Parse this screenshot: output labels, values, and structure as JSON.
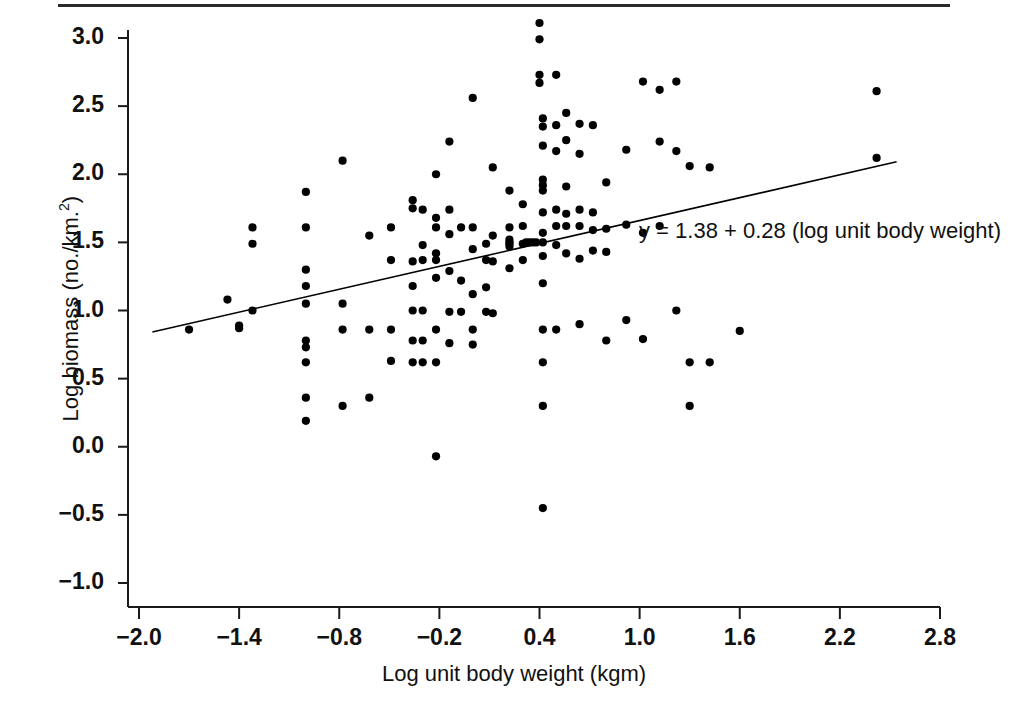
{
  "figure": {
    "background_color": "#ffffff",
    "ink_color": "#000000",
    "rule_color": "#2b2b2b"
  },
  "axes": {
    "x_title": "Log unit body weight (kgm)",
    "y_title_main": "Log biomass (no./km.",
    "y_title_sup": "2",
    "y_title_tail": ")"
  },
  "annotation": {
    "equation": "y = 1.38 + 0.28 (log unit body weight)"
  },
  "chart_data": {
    "type": "scatter",
    "title": "",
    "xlabel": "Log unit body weight (kgm)",
    "ylabel": "Log biomass (no./km.2)",
    "xlim": [
      -2.0,
      2.8
    ],
    "ylim": [
      -1.0,
      3.0
    ],
    "xticks": [
      -2.0,
      -1.4,
      -0.8,
      -0.2,
      0.4,
      1.0,
      1.6,
      2.2,
      2.8
    ],
    "xtick_labels": [
      "−2.0",
      "−1.4",
      "−0.8",
      "−0.2",
      "0.4",
      "1.0",
      "1.6",
      "2.2",
      "2.8"
    ],
    "yticks": [
      -1.0,
      -0.5,
      0.0,
      0.5,
      1.0,
      1.5,
      2.0,
      2.5,
      3.0
    ],
    "ytick_labels": [
      "−1.0",
      "−0.5",
      "0.0",
      "0.5",
      "1.0",
      "1.5",
      "2.0",
      "2.5",
      "3.0"
    ],
    "grid": false,
    "legend": null,
    "marker": {
      "shape": "circle",
      "color": "#000000",
      "size_px": 5
    },
    "fit_line": {
      "label": "y = 1.38 + 0.28 (log unit body weight)",
      "intercept": 1.38,
      "slope": 0.28,
      "x_start": -1.92,
      "x_end": 2.54,
      "color": "#000000",
      "width_px": 1.6
    },
    "points": [
      [
        -1.7,
        0.86
      ],
      [
        -1.47,
        1.08
      ],
      [
        -1.4,
        0.87
      ],
      [
        -1.4,
        0.89
      ],
      [
        -1.32,
        1.61
      ],
      [
        -1.32,
        1.49
      ],
      [
        -1.32,
        1.0
      ],
      [
        -1.0,
        1.87
      ],
      [
        -1.0,
        1.61
      ],
      [
        -1.0,
        1.3
      ],
      [
        -1.0,
        1.18
      ],
      [
        -1.0,
        1.05
      ],
      [
        -1.0,
        0.78
      ],
      [
        -1.0,
        0.73
      ],
      [
        -1.0,
        0.62
      ],
      [
        -1.0,
        0.36
      ],
      [
        -1.0,
        0.19
      ],
      [
        -0.78,
        2.1
      ],
      [
        -0.78,
        1.05
      ],
      [
        -0.78,
        0.86
      ],
      [
        -0.78,
        0.3
      ],
      [
        -0.62,
        1.55
      ],
      [
        -0.62,
        0.86
      ],
      [
        -0.62,
        0.36
      ],
      [
        -0.49,
        1.61
      ],
      [
        -0.49,
        1.37
      ],
      [
        -0.49,
        0.86
      ],
      [
        -0.49,
        0.63
      ],
      [
        -0.36,
        1.81
      ],
      [
        -0.36,
        1.75
      ],
      [
        -0.36,
        1.36
      ],
      [
        -0.36,
        1.18
      ],
      [
        -0.36,
        1.0
      ],
      [
        -0.36,
        0.78
      ],
      [
        -0.36,
        0.62
      ],
      [
        -0.3,
        1.74
      ],
      [
        -0.3,
        1.48
      ],
      [
        -0.3,
        1.37
      ],
      [
        -0.3,
        1.0
      ],
      [
        -0.3,
        0.78
      ],
      [
        -0.3,
        0.62
      ],
      [
        -0.22,
        2.0
      ],
      [
        -0.22,
        1.68
      ],
      [
        -0.22,
        1.61
      ],
      [
        -0.22,
        1.42
      ],
      [
        -0.22,
        1.37
      ],
      [
        -0.22,
        1.24
      ],
      [
        -0.22,
        0.86
      ],
      [
        -0.22,
        0.62
      ],
      [
        -0.22,
        -0.07
      ],
      [
        -0.14,
        2.24
      ],
      [
        -0.14,
        1.74
      ],
      [
        -0.14,
        1.56
      ],
      [
        -0.14,
        1.29
      ],
      [
        -0.14,
        0.99
      ],
      [
        -0.14,
        0.76
      ],
      [
        -0.07,
        1.61
      ],
      [
        -0.07,
        1.22
      ],
      [
        -0.07,
        0.99
      ],
      [
        0.0,
        2.56
      ],
      [
        0.0,
        1.61
      ],
      [
        0.0,
        1.45
      ],
      [
        0.0,
        1.12
      ],
      [
        0.0,
        0.86
      ],
      [
        0.0,
        0.75
      ],
      [
        0.08,
        1.49
      ],
      [
        0.08,
        1.37
      ],
      [
        0.08,
        1.17
      ],
      [
        0.08,
        0.99
      ],
      [
        0.12,
        2.05
      ],
      [
        0.12,
        1.55
      ],
      [
        0.12,
        1.36
      ],
      [
        0.12,
        0.98
      ],
      [
        0.22,
        1.88
      ],
      [
        0.22,
        1.61
      ],
      [
        0.22,
        1.52
      ],
      [
        0.22,
        1.5
      ],
      [
        0.22,
        1.49
      ],
      [
        0.22,
        1.47
      ],
      [
        0.22,
        1.31
      ],
      [
        0.3,
        1.78
      ],
      [
        0.3,
        1.62
      ],
      [
        0.3,
        1.49
      ],
      [
        0.3,
        1.37
      ],
      [
        0.32,
        1.5
      ],
      [
        0.34,
        1.5
      ],
      [
        0.36,
        1.5
      ],
      [
        0.38,
        1.5
      ],
      [
        0.4,
        3.11
      ],
      [
        0.4,
        2.99
      ],
      [
        0.4,
        2.73
      ],
      [
        0.4,
        2.67
      ],
      [
        0.42,
        2.41
      ],
      [
        0.42,
        2.35
      ],
      [
        0.42,
        2.21
      ],
      [
        0.42,
        1.96
      ],
      [
        0.42,
        1.92
      ],
      [
        0.42,
        1.88
      ],
      [
        0.42,
        1.72
      ],
      [
        0.42,
        1.57
      ],
      [
        0.42,
        1.5
      ],
      [
        0.42,
        1.4
      ],
      [
        0.42,
        1.2
      ],
      [
        0.42,
        0.86
      ],
      [
        0.42,
        0.62
      ],
      [
        0.42,
        0.3
      ],
      [
        0.42,
        -0.45
      ],
      [
        0.5,
        2.73
      ],
      [
        0.5,
        2.36
      ],
      [
        0.5,
        2.17
      ],
      [
        0.5,
        1.74
      ],
      [
        0.5,
        1.62
      ],
      [
        0.5,
        1.48
      ],
      [
        0.5,
        0.86
      ],
      [
        0.56,
        2.45
      ],
      [
        0.56,
        2.25
      ],
      [
        0.56,
        1.91
      ],
      [
        0.56,
        1.71
      ],
      [
        0.56,
        1.62
      ],
      [
        0.56,
        1.42
      ],
      [
        0.64,
        2.37
      ],
      [
        0.64,
        2.15
      ],
      [
        0.64,
        1.74
      ],
      [
        0.64,
        1.62
      ],
      [
        0.64,
        1.38
      ],
      [
        0.64,
        0.9
      ],
      [
        0.72,
        2.36
      ],
      [
        0.72,
        1.72
      ],
      [
        0.72,
        1.59
      ],
      [
        0.72,
        1.44
      ],
      [
        0.8,
        1.94
      ],
      [
        0.8,
        1.6
      ],
      [
        0.8,
        1.43
      ],
      [
        0.8,
        0.78
      ],
      [
        0.92,
        2.18
      ],
      [
        0.92,
        1.63
      ],
      [
        0.92,
        0.93
      ],
      [
        1.02,
        2.68
      ],
      [
        1.02,
        1.57
      ],
      [
        1.02,
        0.79
      ],
      [
        1.12,
        2.62
      ],
      [
        1.12,
        2.24
      ],
      [
        1.12,
        1.62
      ],
      [
        1.22,
        2.68
      ],
      [
        1.22,
        2.17
      ],
      [
        1.22,
        1.0
      ],
      [
        1.3,
        2.06
      ],
      [
        1.3,
        0.62
      ],
      [
        1.3,
        0.3
      ],
      [
        1.42,
        2.05
      ],
      [
        1.42,
        0.62
      ],
      [
        1.6,
        0.85
      ],
      [
        2.42,
        2.61
      ],
      [
        2.42,
        2.12
      ]
    ]
  }
}
